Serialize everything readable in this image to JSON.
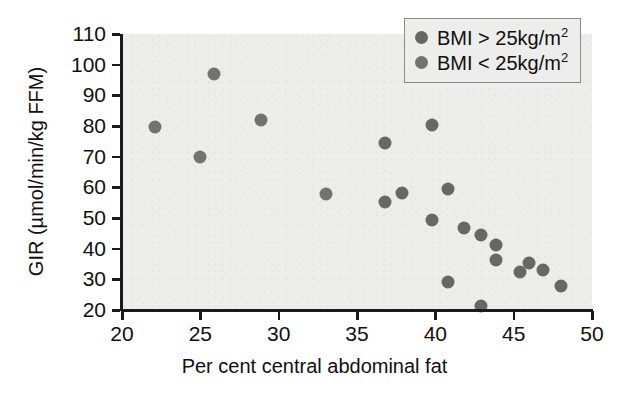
{
  "chart_data": {
    "type": "scatter",
    "title": "",
    "xlabel": "Per cent central abdominal fat",
    "ylabel": "GIR (µmol/min/kg FFM)",
    "xlim": [
      20,
      50
    ],
    "ylim": [
      20,
      110
    ],
    "xticks": [
      20,
      25,
      30,
      35,
      40,
      45,
      50
    ],
    "yticks": [
      20,
      30,
      40,
      50,
      60,
      70,
      80,
      90,
      100,
      110
    ],
    "grid": false,
    "legend_position": "top-right",
    "marker_color": "#6a6a6a",
    "plot_background": "#ededec",
    "series": [
      {
        "name": "BMI > 25kg/m²",
        "marker_color": "#676767",
        "points": [
          [
            39.8,
            80.3
          ],
          [
            36.8,
            74.3
          ],
          [
            40.8,
            59.3
          ],
          [
            37.9,
            58.2
          ],
          [
            36.8,
            55.1
          ],
          [
            39.8,
            49.3
          ],
          [
            41.8,
            46.7
          ],
          [
            42.9,
            44.3
          ],
          [
            43.9,
            41.3
          ],
          [
            43.9,
            36.3
          ],
          [
            46.0,
            35.3
          ],
          [
            46.9,
            33.0
          ],
          [
            45.4,
            32.3
          ],
          [
            40.8,
            29.0
          ],
          [
            48.0,
            27.7
          ],
          [
            42.9,
            21.3
          ]
        ]
      },
      {
        "name": "BMI < 25kg/m²",
        "marker_color": "#727272",
        "points": [
          [
            25.9,
            97.0
          ],
          [
            28.9,
            82.0
          ],
          [
            22.1,
            79.7
          ],
          [
            25.0,
            69.8
          ],
          [
            33.0,
            57.8
          ]
        ]
      }
    ]
  },
  "axes": {
    "x_title": "Per cent central abdominal fat",
    "y_title": "GIR (µmol/min/kg FFM)",
    "x_tick_labels": [
      "20",
      "25",
      "30",
      "35",
      "40",
      "45",
      "50"
    ],
    "y_tick_labels": [
      "20",
      "30",
      "40",
      "50",
      "60",
      "70",
      "80",
      "90",
      "100",
      "110"
    ]
  },
  "legend": {
    "entries": [
      {
        "prefix": "BMI > 25kg/m",
        "sup": "2"
      },
      {
        "prefix": "BMI < 25kg/m",
        "sup": "2"
      }
    ]
  }
}
